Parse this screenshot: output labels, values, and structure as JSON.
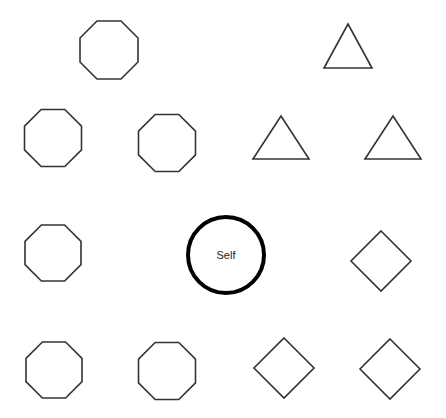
{
  "diagram": {
    "stroke_color": "#333333",
    "self_stroke_color": "#000000",
    "background": "#ffffff",
    "self_node": {
      "label": "Self",
      "cx": 226,
      "cy": 255,
      "r": 38,
      "stroke_width": 4
    },
    "shapes": [
      {
        "id": "octagon-1",
        "type": "octagon",
        "cx": 109,
        "cy": 50,
        "size": 58
      },
      {
        "id": "triangle-1",
        "type": "triangle",
        "apex": [
          348,
          24
        ],
        "base_left": [
          324,
          68
        ],
        "base_right": [
          372,
          68
        ]
      },
      {
        "id": "octagon-2",
        "type": "octagon",
        "cx": 53,
        "cy": 138,
        "size": 57
      },
      {
        "id": "octagon-3",
        "type": "octagon",
        "cx": 167,
        "cy": 143,
        "size": 57
      },
      {
        "id": "triangle-2",
        "type": "triangle",
        "apex": [
          281,
          116
        ],
        "base_left": [
          253,
          159
        ],
        "base_right": [
          309,
          159
        ]
      },
      {
        "id": "triangle-3",
        "type": "triangle",
        "apex": [
          393,
          116
        ],
        "base_left": [
          365,
          159
        ],
        "base_right": [
          421,
          159
        ]
      },
      {
        "id": "octagon-4",
        "type": "octagon",
        "cx": 53,
        "cy": 253,
        "size": 56
      },
      {
        "id": "diamond-1",
        "type": "diamond",
        "cx": 381,
        "cy": 261,
        "half": 30
      },
      {
        "id": "octagon-5",
        "type": "octagon",
        "cx": 54,
        "cy": 370,
        "size": 56
      },
      {
        "id": "octagon-6",
        "type": "octagon",
        "cx": 167,
        "cy": 371,
        "size": 57
      },
      {
        "id": "diamond-2",
        "type": "diamond",
        "cx": 284,
        "cy": 368,
        "half": 30
      },
      {
        "id": "diamond-3",
        "type": "diamond",
        "cx": 390,
        "cy": 369,
        "half": 30
      }
    ]
  }
}
